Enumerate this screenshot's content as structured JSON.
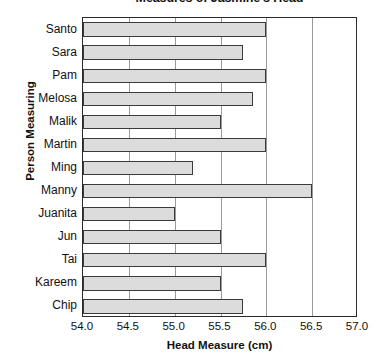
{
  "chart_data": {
    "type": "bar",
    "orientation": "horizontal",
    "title": "Measures of Jasmine's Head",
    "xlabel": "Head Measure (cm)",
    "ylabel": "Person Measuring",
    "categories": [
      "Santo",
      "Sara",
      "Pam",
      "Melosa",
      "Malik",
      "Martin",
      "Ming",
      "Manny",
      "Juanita",
      "Jun",
      "Tai",
      "Kareem",
      "Chip"
    ],
    "values": [
      56.0,
      55.75,
      56.0,
      55.85,
      55.5,
      56.0,
      55.2,
      56.5,
      55.0,
      55.5,
      56.0,
      55.5,
      55.75
    ],
    "xlim": [
      54.0,
      57.0
    ],
    "xticks": [
      "54.0",
      "54.5",
      "55.0",
      "55.5",
      "56.0",
      "56.5",
      "57.0"
    ],
    "xtick_values": [
      54.0,
      54.5,
      55.0,
      55.5,
      56.0,
      56.5,
      57.0
    ],
    "grid": "vertical",
    "legend": "none",
    "bar_fill_color": "#dcdcdc",
    "bar_edge_color": "#3a3a3a",
    "gridline_color": "#9a9a9a",
    "axis_color": "#2b2b2b",
    "background_color": "#ffffff"
  }
}
